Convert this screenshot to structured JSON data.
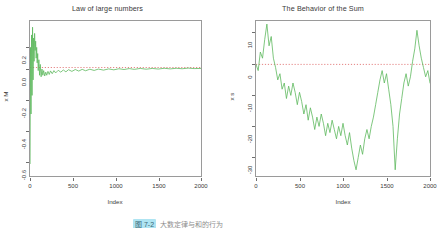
{
  "figure": {
    "background": "#ffffff",
    "series_color": "#5cb85c",
    "zero_line_color": "#d84b4b",
    "axis_color": "#6e6e6e"
  },
  "caption": {
    "highlight_text": "图 7-2",
    "rest_text": "大数定律与和的行为",
    "visible": "partially cut off at bottom edge"
  },
  "chart_data": [
    {
      "type": "line",
      "title": "Law of large numbers",
      "xlabel": "Index",
      "ylabel": "x M",
      "xlim": [
        0,
        2000
      ],
      "ylim": [
        -0.7,
        0.3
      ],
      "xticks": [
        0,
        500,
        1000,
        1500,
        2000
      ],
      "yticks": [
        0.2,
        0.0,
        -0.2,
        -0.4,
        -0.6
      ],
      "xtick_labels": [
        "0",
        "500",
        "1000",
        "1500",
        "2000"
      ],
      "ytick_labels": [
        "0.2",
        "0.0",
        "-0.2",
        "-0.4",
        "-0.6"
      ],
      "grid": false,
      "legend": null,
      "annotations": [
        {
          "type": "hline",
          "y": 0.0,
          "style": "dotted",
          "color": "#d84b4b"
        }
      ],
      "series": [
        {
          "name": "running mean",
          "color": "#5cb85c",
          "description": "Running mean of i.i.d. draws: violent oscillation for small index, damping toward 0 as index grows.",
          "x": [
            1,
            6,
            12,
            18,
            24,
            30,
            36,
            42,
            48,
            54,
            60,
            66,
            72,
            78,
            84,
            90,
            96,
            104,
            112,
            120,
            130,
            140,
            150,
            160,
            172,
            184,
            196,
            210,
            225,
            240,
            260,
            280,
            300,
            330,
            360,
            390,
            420,
            450,
            490,
            530,
            570,
            610,
            650,
            700,
            750,
            800,
            860,
            920,
            980,
            1040,
            1100,
            1160,
            1220,
            1290,
            1360,
            1430,
            1500,
            1570,
            1640,
            1710,
            1780,
            1850,
            1920,
            2000
          ],
          "y": [
            -0.62,
            0.13,
            -0.3,
            0.21,
            -0.18,
            0.26,
            -0.08,
            0.19,
            0.04,
            0.22,
            0.11,
            0.17,
            0.06,
            0.13,
            0.03,
            0.09,
            -0.02,
            0.05,
            -0.05,
            0.02,
            -0.06,
            -0.01,
            -0.05,
            -0.02,
            -0.055,
            -0.03,
            -0.05,
            -0.025,
            -0.045,
            -0.022,
            -0.04,
            -0.02,
            -0.035,
            -0.018,
            -0.03,
            -0.016,
            -0.028,
            -0.014,
            -0.025,
            -0.013,
            -0.023,
            -0.012,
            -0.021,
            -0.011,
            -0.019,
            -0.01,
            -0.017,
            -0.009,
            -0.015,
            -0.008,
            -0.013,
            -0.007,
            -0.012,
            -0.006,
            -0.011,
            -0.006,
            -0.01,
            -0.005,
            -0.009,
            -0.005,
            -0.008,
            -0.004,
            -0.007,
            -0.006
          ]
        }
      ]
    },
    {
      "type": "line",
      "title": "The Behavior of the Sum",
      "xlabel": "Index",
      "ylabel": "x s",
      "xlim": [
        0,
        2000
      ],
      "ylim": [
        -36,
        14
      ],
      "xticks": [
        0,
        500,
        1000,
        1500,
        2000
      ],
      "yticks": [
        10,
        0,
        -10,
        -20,
        -30
      ],
      "xtick_labels": [
        "0",
        "500",
        "1000",
        "1500",
        "2000"
      ],
      "ytick_labels": [
        "10",
        "0",
        "-10",
        "-20",
        "-30"
      ],
      "grid": false,
      "legend": null,
      "annotations": [
        {
          "type": "hline",
          "y": 0,
          "style": "dotted",
          "color": "#d84b4b"
        }
      ],
      "series": [
        {
          "name": "cumulative sum",
          "color": "#5cb85c",
          "description": "Random walk of the cumulative sum: rises to ~+13 early, drifts down to ~-34 near index 1150 and 1600, then rallies to ~+11 near index 1850.",
          "x": [
            0,
            25,
            50,
            75,
            100,
            125,
            150,
            175,
            200,
            225,
            250,
            275,
            300,
            325,
            350,
            375,
            400,
            425,
            450,
            475,
            500,
            525,
            550,
            575,
            600,
            625,
            650,
            675,
            700,
            725,
            750,
            775,
            800,
            825,
            850,
            875,
            900,
            925,
            950,
            975,
            1000,
            1025,
            1050,
            1075,
            1100,
            1125,
            1150,
            1175,
            1200,
            1225,
            1250,
            1275,
            1300,
            1325,
            1350,
            1375,
            1400,
            1425,
            1450,
            1475,
            1500,
            1525,
            1550,
            1575,
            1600,
            1625,
            1650,
            1675,
            1700,
            1725,
            1750,
            1775,
            1800,
            1825,
            1850,
            1875,
            1900,
            1925,
            1950,
            1975,
            2000
          ],
          "y": [
            0,
            -2,
            4,
            2,
            8,
            13,
            6,
            9,
            2,
            -1,
            -5,
            -3,
            -8,
            -6,
            -11,
            -7,
            -10,
            -6,
            -9,
            -13,
            -9,
            -12,
            -16,
            -13,
            -18,
            -14,
            -17,
            -21,
            -17,
            -20,
            -16,
            -19,
            -23,
            -19,
            -22,
            -18,
            -21,
            -24,
            -20,
            -23,
            -19,
            -23,
            -26,
            -22,
            -27,
            -31,
            -34,
            -30,
            -26,
            -29,
            -24,
            -21,
            -24,
            -20,
            -17,
            -13,
            -9,
            -5,
            -2,
            -6,
            -3,
            -8,
            -13,
            -20,
            -34,
            -24,
            -16,
            -11,
            -6,
            -3,
            -7,
            -4,
            1,
            5,
            11,
            6,
            2,
            -1,
            -4,
            -2,
            -6
          ]
        }
      ]
    }
  ]
}
